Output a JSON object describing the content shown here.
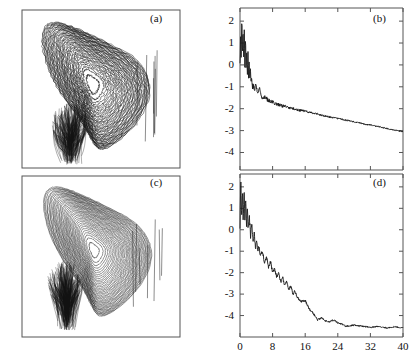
{
  "figure": {
    "width": 416,
    "height": 359,
    "background": "#ffffff",
    "ink_color": "#1a1a1a",
    "frame_color": "#555555"
  },
  "panels": {
    "a": {
      "label": "(a)",
      "type": "phase-portrait"
    },
    "b": {
      "label": "(b)",
      "type": "line"
    },
    "c": {
      "label": "(c)",
      "type": "phase-portrait"
    },
    "d": {
      "label": "(d)",
      "type": "line"
    }
  },
  "axes": {
    "b": {
      "ytick_labels": [
        "2",
        "1",
        "0",
        "-1",
        "-2",
        "-3",
        "-4"
      ],
      "xtick_labels": [
        "",
        "",
        "",
        "",
        "",
        ""
      ]
    },
    "d": {
      "ytick_labels": [
        "2",
        "1",
        "0",
        "-1",
        "-2",
        "-3",
        "-4"
      ],
      "xtick_labels": [
        "0",
        "8",
        "16",
        "24",
        "32",
        "40"
      ]
    }
  },
  "chart_data": [
    {
      "id": "a",
      "type": "line",
      "title": "(a)",
      "xlabel": "",
      "ylabel": "",
      "grid": false,
      "legend": null,
      "description": "Strange-attractor phase portrait: dense tangle of many overlapping trajectory loops forming a rounded wedge, broad at upper-left, tapering to a sharp cusp at bottom-center-left; a dense black knot of orbits occupies the lower-left interior.",
      "xlim": [
        0,
        1
      ],
      "ylim": [
        0,
        1
      ],
      "attractor": {
        "center_x": 0.44,
        "center_y": 0.47,
        "n_loops": 46,
        "cusp_x": 0.3,
        "cusp_y": 0.97,
        "dense_core_x": 0.3,
        "dense_core_y": 0.72,
        "seed": 1741
      }
    },
    {
      "id": "b",
      "type": "line",
      "title": "(b)",
      "xlabel": "",
      "ylabel": "",
      "grid": false,
      "legend": null,
      "xlim": [
        0,
        40
      ],
      "ylim": [
        -4.8,
        2.6
      ],
      "xticks": [
        0,
        8,
        16,
        24,
        32,
        40
      ],
      "yticks": [
        2,
        1,
        0,
        -1,
        -2,
        -3,
        -4
      ],
      "description": "Log-scale decay curve: violent oscillation between +2.2 and -0.6 over x=0..2, rapid drop to about -1.6 by x=4, then a slow nearly linear decline to -3.05 at x=40.",
      "x": [
        0.0,
        0.15,
        0.3,
        0.45,
        0.6,
        0.75,
        0.9,
        1.05,
        1.2,
        1.35,
        1.5,
        1.65,
        1.8,
        1.95,
        2.1,
        2.25,
        2.4,
        2.55,
        2.7,
        2.85,
        3.0,
        3.3,
        3.6,
        3.9,
        4.2,
        4.5,
        4.8,
        5.1,
        5.4,
        5.7,
        6.0,
        6.5,
        7.0,
        7.5,
        8.0,
        9.0,
        10.0,
        11.0,
        12.0,
        13.0,
        14.0,
        15.0,
        16.0,
        18.0,
        20.0,
        22.0,
        24.0,
        26.0,
        28.0,
        30.0,
        32.0,
        34.0,
        36.0,
        38.0,
        40.0
      ],
      "y": [
        0.1,
        1.3,
        0.35,
        2.1,
        0.55,
        1.55,
        0.2,
        1.75,
        -0.1,
        1.25,
        -0.3,
        0.95,
        -0.5,
        0.6,
        -0.6,
        0.25,
        -0.75,
        -0.1,
        -0.85,
        -0.45,
        -0.95,
        -1.0,
        -1.15,
        -0.85,
        -1.2,
        -1.3,
        -1.0,
        -1.35,
        -1.45,
        -1.5,
        -1.45,
        -1.55,
        -1.6,
        -1.65,
        -1.7,
        -1.78,
        -1.85,
        -1.9,
        -1.95,
        -2.0,
        -2.05,
        -2.08,
        -2.12,
        -2.2,
        -2.3,
        -2.38,
        -2.45,
        -2.52,
        -2.6,
        -2.68,
        -2.75,
        -2.82,
        -2.9,
        -2.98,
        -3.05
      ]
    },
    {
      "id": "c",
      "type": "line",
      "title": "(c)",
      "xlabel": "",
      "ylabel": "",
      "grid": false,
      "legend": null,
      "description": "Strange-attractor phase portrait with smoother, more regular nested loops forming a rounded triangular wedge; trajectories sweep from upper-left around to the right apex and converge to a sharp downward cusp at bottom-left-center.",
      "xlim": [
        0,
        1
      ],
      "ylim": [
        0,
        1
      ],
      "attractor": {
        "center_x": 0.45,
        "center_y": 0.46,
        "n_loops": 40,
        "cusp_x": 0.28,
        "cusp_y": 0.95,
        "dense_core_x": 0.27,
        "dense_core_y": 0.66,
        "seed": 908
      }
    },
    {
      "id": "d",
      "type": "line",
      "title": "(d)",
      "xlabel": "",
      "ylabel": "",
      "grid": false,
      "legend": null,
      "xlim": [
        0,
        40
      ],
      "ylim": [
        -5.0,
        2.6
      ],
      "xticks": [
        0,
        8,
        16,
        24,
        32,
        40
      ],
      "yticks": [
        2,
        1,
        0,
        -1,
        -2,
        -3,
        -4
      ],
      "description": "Log-scale decay curve: strong oscillation between +2.3 and 0 over x=0..2, then a steep noisy decay reaching -3 near x=13 and -4.2 near x=19, flattening onto a noisy plateau at about -4.55 from x=26 to 40.",
      "x": [
        0.0,
        0.2,
        0.4,
        0.6,
        0.8,
        1.0,
        1.2,
        1.4,
        1.6,
        1.8,
        2.0,
        2.3,
        2.6,
        2.9,
        3.2,
        3.5,
        3.8,
        4.1,
        4.4,
        4.7,
        5.0,
        5.5,
        6.0,
        6.5,
        7.0,
        7.5,
        8.0,
        8.5,
        9.0,
        9.5,
        10.0,
        10.5,
        11.0,
        11.5,
        12.0,
        12.5,
        13.0,
        13.5,
        14.0,
        15.0,
        16.0,
        17.0,
        18.0,
        19.0,
        20.0,
        21.0,
        22.0,
        23.0,
        24.0,
        25.0,
        26.0,
        28.0,
        30.0,
        32.0,
        34.0,
        36.0,
        38.0,
        40.0
      ],
      "y": [
        0.2,
        2.3,
        0.6,
        1.9,
        0.3,
        2.0,
        0.5,
        1.5,
        0.25,
        1.1,
        0.0,
        0.6,
        -0.3,
        0.35,
        -0.55,
        -0.2,
        -0.9,
        -0.5,
        -1.05,
        -0.7,
        -1.25,
        -1.0,
        -1.55,
        -1.3,
        -1.75,
        -1.5,
        -2.0,
        -1.8,
        -2.2,
        -2.05,
        -2.45,
        -2.25,
        -2.6,
        -2.4,
        -2.8,
        -2.6,
        -3.0,
        -2.85,
        -3.15,
        -3.35,
        -3.3,
        -3.7,
        -3.9,
        -4.2,
        -4.1,
        -4.25,
        -4.3,
        -4.2,
        -4.35,
        -4.4,
        -4.5,
        -4.45,
        -4.5,
        -4.55,
        -4.5,
        -4.58,
        -4.52,
        -4.58
      ]
    }
  ]
}
